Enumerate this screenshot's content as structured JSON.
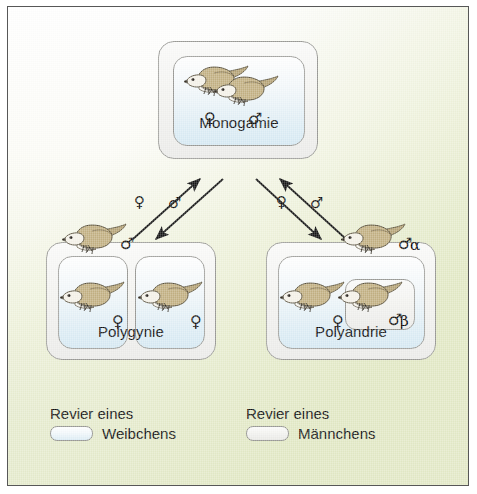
{
  "diagram": {
    "background": {
      "top_color": "#ffffff",
      "bottom_color": "#e4eacd",
      "frame_color": "#575757"
    },
    "colors": {
      "female_territory": "#dfeef6",
      "male_territory": "#f0f0ed",
      "border": "#9a9a96",
      "bird_back": "#b8a878",
      "bird_belly": "#f7f5ef",
      "text": "#111111"
    },
    "symbols": {
      "female": "♀",
      "male": "♂",
      "alpha": "α",
      "beta": "β"
    },
    "nodes": [
      {
        "id": "monogamie",
        "label": "Monogamie",
        "outer_territory": "male",
        "inner_territories": [
          "female"
        ],
        "birds": [
          {
            "sex": "♀",
            "rank": ""
          },
          {
            "sex": "♂",
            "rank": ""
          }
        ]
      },
      {
        "id": "polygynie",
        "label": "Polygynie",
        "outer_territory": "male",
        "inner_territories": [
          "female",
          "female"
        ],
        "birds": [
          {
            "sex": "♂",
            "rank": ""
          },
          {
            "sex": "♀",
            "rank": ""
          },
          {
            "sex": "♀",
            "rank": ""
          }
        ]
      },
      {
        "id": "polyandrie",
        "label": "Polyandrie",
        "outer_territory": "male",
        "inner_territories": [
          "female",
          "male"
        ],
        "birds": [
          {
            "sex": "♂",
            "rank": "α"
          },
          {
            "sex": "♀",
            "rank": ""
          },
          {
            "sex": "♂",
            "rank": "β"
          }
        ]
      }
    ],
    "arrows": [
      {
        "id": "polygynie-to-monogamie",
        "label": "♀",
        "from": "polygynie",
        "to": "monogamie",
        "direction": "up-right"
      },
      {
        "id": "monogamie-to-polygynie",
        "label": "♂",
        "from": "monogamie",
        "to": "polygynie",
        "direction": "down-left"
      },
      {
        "id": "monogamie-to-polyandrie",
        "label": "♀",
        "from": "monogamie",
        "to": "polyandrie",
        "direction": "down-right"
      },
      {
        "id": "polyandrie-to-monogamie",
        "label": "♂",
        "from": "polyandrie",
        "to": "monogamie",
        "direction": "up-left"
      }
    ],
    "legend": [
      {
        "id": "female-territory",
        "line1": "Revier eines",
        "line2": "Weibchens",
        "swatch": "female"
      },
      {
        "id": "male-territory",
        "line1": "Revier eines",
        "line2": "Männchens",
        "swatch": "male"
      }
    ]
  }
}
